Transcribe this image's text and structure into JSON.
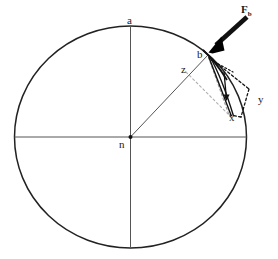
{
  "figure": {
    "type": "geometry-diagram",
    "background_color": "#ffffff",
    "stroke_color": "#1a1a1a",
    "width": 278,
    "height": 259
  },
  "labels": {
    "apex": "a",
    "center": "n",
    "contact_point": "b",
    "radius_label": "z",
    "component_x": "x",
    "component_y": "y",
    "force_main": "F",
    "force_sub": "b"
  },
  "geometry": {
    "circle": {
      "cx": 130.5,
      "cy": 137,
      "rx": 116,
      "ry": 111
    },
    "center_dot": {
      "cx": 130.5,
      "cy": 137,
      "r": 2
    },
    "vertical_axis": {
      "x": 130.5,
      "y1": 26,
      "y2": 248
    },
    "horizontal_axis": {
      "y": 137,
      "x1": 14.5,
      "x2": 246.5
    },
    "radius_line": {
      "x1": 130.5,
      "y1": 137,
      "x2": 208,
      "y2": 55
    },
    "point_b": {
      "x": 208,
      "y": 55
    },
    "point_x": {
      "x": 232,
      "y": 114
    },
    "arrow": {
      "x1": 247,
      "y1": 18,
      "x2": 209.5,
      "y2": 53
    }
  },
  "annotations": {
    "label_a_pos": {
      "x": 127,
      "y": 22
    },
    "label_n_pos": {
      "x": 120,
      "y": 140
    },
    "label_b_pos": {
      "x": 198,
      "y": 52
    },
    "label_z_pos": {
      "x": 182,
      "y": 66
    },
    "label_x_pos": {
      "x": 231,
      "y": 114
    },
    "label_y_pos": {
      "x": 259,
      "y": 96
    },
    "label_F_pos": {
      "x": 243,
      "y": 6
    }
  }
}
